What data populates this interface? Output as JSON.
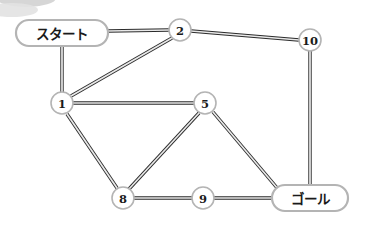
{
  "diagram": {
    "width": 370,
    "height": 225,
    "background_color": "#ffffff",
    "edge_color": "#2b2b2b",
    "edge_fill_color": "#e9e9e9",
    "node_stroke_color": "#b4b4b4",
    "node_fill_color": "#ffffff",
    "label_color": "#1a1a1a"
  },
  "nodes": [
    {
      "id": "start",
      "label": "スタート",
      "shape": "pill",
      "x": 62,
      "y": 33,
      "rx": 46,
      "ry": 13
    },
    {
      "id": "n2",
      "label": "2",
      "shape": "circle",
      "x": 180,
      "y": 30,
      "r": 11
    },
    {
      "id": "n10",
      "label": "10",
      "shape": "circle",
      "x": 310,
      "y": 40,
      "r": 11
    },
    {
      "id": "n1",
      "label": "1",
      "shape": "circle",
      "x": 62,
      "y": 103,
      "r": 11
    },
    {
      "id": "n5",
      "label": "5",
      "shape": "circle",
      "x": 205,
      "y": 103,
      "r": 11
    },
    {
      "id": "n8",
      "label": "8",
      "shape": "circle",
      "x": 123,
      "y": 198,
      "r": 11
    },
    {
      "id": "n9",
      "label": "9",
      "shape": "circle",
      "x": 203,
      "y": 198,
      "r": 11
    },
    {
      "id": "goal",
      "label": "ゴール",
      "shape": "pill",
      "x": 310,
      "y": 198,
      "rx": 38,
      "ry": 13
    }
  ],
  "edges": [
    {
      "id": "e-start-2",
      "from": "start",
      "to": "n2",
      "x1": 108,
      "y1": 31,
      "x2": 169,
      "y2": 30
    },
    {
      "id": "e-start-1",
      "from": "start",
      "to": "n1",
      "x1": 62,
      "y1": 46,
      "x2": 62,
      "y2": 92
    },
    {
      "id": "e-1-2",
      "from": "n1",
      "to": "n2",
      "x1": 71,
      "y1": 96,
      "x2": 172,
      "y2": 38
    },
    {
      "id": "e-2-10",
      "from": "n2",
      "to": "n10",
      "x1": 191,
      "y1": 31,
      "x2": 299,
      "y2": 40
    },
    {
      "id": "e-1-5",
      "from": "n1",
      "to": "n5",
      "x1": 73,
      "y1": 103,
      "x2": 194,
      "y2": 103
    },
    {
      "id": "e-1-8",
      "from": "n1",
      "to": "n8",
      "x1": 67,
      "y1": 114,
      "x2": 117,
      "y2": 188
    },
    {
      "id": "e-5-8",
      "from": "n5",
      "to": "n8",
      "x1": 199,
      "y1": 113,
      "x2": 129,
      "y2": 189
    },
    {
      "id": "e-5-goal",
      "from": "n5",
      "to": "goal",
      "x1": 213,
      "y1": 112,
      "x2": 278,
      "y2": 189
    },
    {
      "id": "e-8-9",
      "from": "n8",
      "to": "n9",
      "x1": 134,
      "y1": 198,
      "x2": 192,
      "y2": 198
    },
    {
      "id": "e-9-goal",
      "from": "n9",
      "to": "goal",
      "x1": 214,
      "y1": 198,
      "x2": 272,
      "y2": 198
    },
    {
      "id": "e-10-goal",
      "from": "n10",
      "to": "goal",
      "x1": 310,
      "y1": 51,
      "x2": 310,
      "y2": 185
    }
  ],
  "artifacts": {
    "corner_smudge_label": "scan-artifact-top-left"
  }
}
